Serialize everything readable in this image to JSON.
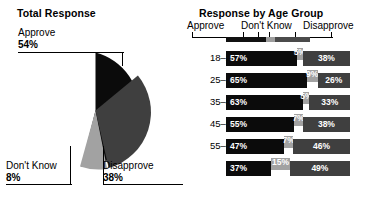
{
  "pie_chart": {
    "title": "Total Response",
    "labels": {
      "approve": {
        "name": "Approve",
        "pct": "54%"
      },
      "dont_know": {
        "name": "Don't Know",
        "pct": "8%"
      },
      "disapprove": {
        "name": "Disapprove",
        "pct": "38%"
      }
    }
  },
  "bar_chart": {
    "title": "Response by Age Group",
    "legend": {
      "approve": "Approve",
      "dont_know": "Don't Know",
      "disapprove": "Disapprove"
    },
    "rows": [
      {
        "label": "18–24yrs",
        "approve": "57%",
        "dont_know": "5%",
        "disapprove": "38%"
      },
      {
        "label": "25–34yrs",
        "approve": "65%",
        "dont_know": "9%",
        "disapprove": "26%"
      },
      {
        "label": "35–44yrs",
        "approve": "63%",
        "dont_know": "5%",
        "disapprove": "33%"
      },
      {
        "label": "45–54yrs",
        "approve": "55%",
        "dont_know": "7%",
        "disapprove": "38%"
      },
      {
        "label": "55–64yrs",
        "approve": "47%",
        "dont_know": "7%",
        "disapprove": "46%"
      },
      {
        "label": "65+",
        "approve": "37%",
        "dont_know": "15%",
        "disapprove": "49%"
      }
    ]
  },
  "colors": {
    "approve": "#0b0b0b",
    "dont_know": "#a2a2a2",
    "disapprove": "#3f3f3f",
    "background": "#ffffff",
    "text": "#000000"
  },
  "chart_data": [
    {
      "type": "pie",
      "title": "Total Response",
      "categories": [
        "Approve",
        "Don't Know",
        "Disapprove"
      ],
      "values": [
        54,
        8,
        38
      ],
      "unit": "percent",
      "labels_shown": [
        "Approve 54%",
        "Don't Know 8%",
        "Disapprove 38%"
      ],
      "colors": [
        "#0b0b0b",
        "#a2a2a2",
        "#3f3f3f"
      ],
      "legend": "callout-labels-with-leader-lines",
      "grid": false
    },
    {
      "type": "bar",
      "orientation": "horizontal",
      "stacked": true,
      "title": "Response by Age Group",
      "categories": [
        "18–24yrs",
        "25–34yrs",
        "35–44yrs",
        "45–54yrs",
        "55–64yrs",
        "65+"
      ],
      "series": [
        {
          "name": "Approve",
          "values": [
            57,
            65,
            63,
            55,
            47,
            37
          ],
          "color": "#0b0b0b"
        },
        {
          "name": "Don't Know",
          "values": [
            5,
            9,
            5,
            7,
            7,
            15
          ],
          "color": "#a2a2a2"
        },
        {
          "name": "Disapprove",
          "values": [
            38,
            26,
            33,
            38,
            46,
            49
          ],
          "color": "#3f3f3f"
        }
      ],
      "xlabel": "",
      "ylabel": "",
      "xlim": [
        0,
        100
      ],
      "unit": "percent",
      "grid": false,
      "legend_position": "top",
      "data_labels": true
    }
  ]
}
